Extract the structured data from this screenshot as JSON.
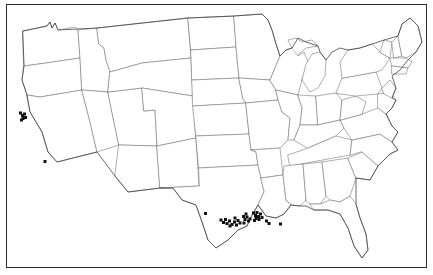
{
  "figure": {
    "type": "distribution-map",
    "region": "Contiguous United States",
    "title": "",
    "caption": "",
    "frame": {
      "visible": true,
      "color": "#2b2b2b",
      "width_px": 1.4
    },
    "background_color": "#ffffff",
    "state_border_color": "#6d6d6d",
    "coastline_color": "#3a3a3a",
    "marker_color": "#111111",
    "marker_shape": "filled-square",
    "marker_size_px": 3
  },
  "chart_data": {
    "type": "scatter",
    "title": "",
    "xlabel": "",
    "ylabel": "",
    "projection": "generic-us-outline",
    "legend": [],
    "grid": false,
    "clusters": [
      {
        "name": "San Francisco Bay Area",
        "count": 6,
        "points": [
          {
            "x": 20.5,
            "y": 113.0
          },
          {
            "x": 22.5,
            "y": 115.5
          },
          {
            "x": 24.5,
            "y": 114.0
          },
          {
            "x": 23.0,
            "y": 118.5
          },
          {
            "x": 25.5,
            "y": 117.5
          },
          {
            "x": 21.5,
            "y": 120.0
          }
        ]
      },
      {
        "name": "Southern California Coast",
        "count": 1,
        "points": [
          {
            "x": 45.0,
            "y": 161.5
          }
        ]
      },
      {
        "name": "Central Texas",
        "count": 1,
        "points": [
          {
            "x": 205.5,
            "y": 213.5
          }
        ]
      },
      {
        "name": "Texas Gulf Coast",
        "count": 12,
        "points": [
          {
            "x": 221.0,
            "y": 220.0
          },
          {
            "x": 223.5,
            "y": 222.5
          },
          {
            "x": 225.5,
            "y": 219.5
          },
          {
            "x": 227.0,
            "y": 223.5
          },
          {
            "x": 229.5,
            "y": 221.0
          },
          {
            "x": 232.0,
            "y": 224.5
          },
          {
            "x": 234.5,
            "y": 222.0
          },
          {
            "x": 236.5,
            "y": 225.0
          },
          {
            "x": 238.0,
            "y": 220.5
          },
          {
            "x": 240.0,
            "y": 223.0
          },
          {
            "x": 235.0,
            "y": 218.0
          },
          {
            "x": 230.0,
            "y": 226.0
          }
        ]
      },
      {
        "name": "Upper Texas Coast / Houston",
        "count": 7,
        "points": [
          {
            "x": 243.5,
            "y": 216.5
          },
          {
            "x": 245.0,
            "y": 219.5
          },
          {
            "x": 247.0,
            "y": 217.0
          },
          {
            "x": 248.5,
            "y": 221.0
          },
          {
            "x": 244.0,
            "y": 223.0
          },
          {
            "x": 250.0,
            "y": 219.0
          },
          {
            "x": 246.0,
            "y": 214.0
          }
        ]
      },
      {
        "name": "Southwest Louisiana",
        "count": 9,
        "points": [
          {
            "x": 253.5,
            "y": 213.0
          },
          {
            "x": 255.5,
            "y": 215.5
          },
          {
            "x": 257.0,
            "y": 212.5
          },
          {
            "x": 258.5,
            "y": 216.5
          },
          {
            "x": 260.5,
            "y": 214.0
          },
          {
            "x": 256.0,
            "y": 218.5
          },
          {
            "x": 259.0,
            "y": 219.5
          },
          {
            "x": 262.0,
            "y": 217.5
          },
          {
            "x": 254.5,
            "y": 220.5
          }
        ]
      },
      {
        "name": "South Louisiana",
        "count": 3,
        "points": [
          {
            "x": 266.5,
            "y": 221.0
          },
          {
            "x": 269.0,
            "y": 223.5
          },
          {
            "x": 280.5,
            "y": 224.0
          }
        ]
      }
    ],
    "total_points": 39
  }
}
